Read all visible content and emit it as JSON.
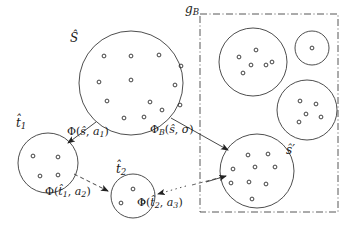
{
  "figure": {
    "type": "diagram",
    "background_color": "#ffffff",
    "stroke_color": "#333333"
  },
  "boundary_box": {
    "label_base": "g",
    "label_sub": "B",
    "style": "dash-dot",
    "x": 200,
    "y": 14,
    "width": 138,
    "height": 198
  },
  "circles": [
    {
      "name": "s-hat-circle",
      "label_base": "S",
      "label_accent": "hat",
      "label_prime": "",
      "cx": 131,
      "cy": 83,
      "r": 52,
      "label_x": 72,
      "label_y": 34,
      "points": 13
    },
    {
      "name": "t1-hat-circle",
      "label_base": "t",
      "label_accent": "hat",
      "label_sub": "1",
      "cx": 48,
      "cy": 163,
      "r": 30,
      "label_x": 18,
      "label_y": 119,
      "points": 4
    },
    {
      "name": "t2-hat-circle",
      "label_base": "t",
      "label_accent": "hat",
      "label_sub": "2",
      "cx": 133,
      "cy": 196,
      "r": 22,
      "label_x": 118,
      "label_y": 165,
      "points": 3
    },
    {
      "name": "s-prime-circle",
      "label_base": "s",
      "label_accent": "hat",
      "label_prime": "'",
      "cx": 257,
      "cy": 171,
      "r": 37,
      "label_x": 288,
      "label_y": 147,
      "points": 9
    },
    {
      "name": "cluster-circle-top-left",
      "label_base": "",
      "cx": 253,
      "cy": 62,
      "r": 34,
      "points": 6
    },
    {
      "name": "cluster-circle-top-right",
      "label_base": "",
      "cx": 312,
      "cy": 48,
      "r": 17,
      "points": 1
    },
    {
      "name": "cluster-circle-mid-right",
      "label_base": "",
      "cx": 307,
      "cy": 110,
      "r": 30,
      "points": 5
    }
  ],
  "edges": [
    {
      "name": "edge-s-to-t1",
      "style": "solid",
      "label": "Φ(ŝ, a₁)",
      "label_x": 69,
      "label_y": 130,
      "from": "s-hat-circle",
      "to": "t1-hat-circle"
    },
    {
      "name": "edge-t1-to-t2",
      "style": "dashed",
      "label": "Φ(t̂1, a₂)",
      "label_x": 47,
      "label_y": 190,
      "from": "t1-hat-circle",
      "to": "t2-hat-circle"
    },
    {
      "name": "edge-t2-to-next",
      "style": "dotted",
      "label": "Φ(t̂2, a₃)",
      "label_x": 139,
      "label_y": 200,
      "from": "t2-hat-circle",
      "to": "s-prime-circle"
    },
    {
      "name": "edge-s-to-sprime",
      "style": "solid",
      "label": "ΦB(ŝ, σ)",
      "label_x": 152,
      "label_y": 128,
      "from": "s-hat-circle",
      "to": "s-prime-circle"
    }
  ],
  "edge_labels": {
    "phi_s_a1": {
      "fn": "Φ",
      "args_open": "(",
      "arg1": "ŝ",
      "comma": ", ",
      "arg2": "a",
      "arg2_sub": "1",
      "args_close": ")"
    },
    "phi_t1_a2": {
      "fn": "Φ",
      "args_open": "(",
      "arg1": "t̂",
      "arg1_sub": "1",
      "comma": ", ",
      "arg2": "a",
      "arg2_sub": "2",
      "args_close": ")"
    },
    "phi_t2_a3": {
      "fn": "Φ",
      "args_open": "(",
      "arg1": "t̂",
      "arg1_sub": "2",
      "comma": ", ",
      "arg2": "a",
      "arg2_sub": "3",
      "args_close": ")"
    },
    "phi_B_s_sig": {
      "fn": "Φ",
      "fn_sub": "B",
      "args_open": "(",
      "arg1": "ŝ",
      "comma": ", ",
      "arg2": "σ",
      "args_close": ")"
    }
  },
  "set_labels": {
    "s_hat": "Ŝ",
    "t1_hat": "t̂",
    "t1_sub": "1",
    "t2_hat": "t̂",
    "t2_sub": "2",
    "s_prime": "ŝ′",
    "g_B": "g",
    "g_B_sub": "B"
  },
  "points": {
    "s_hat_circle": [
      [
        104,
        56
      ],
      [
        131,
        56
      ],
      [
        159,
        55
      ],
      [
        181,
        66
      ],
      [
        99,
        82
      ],
      [
        131,
        80
      ],
      [
        175,
        85
      ],
      [
        107,
        101
      ],
      [
        150,
        102
      ],
      [
        180,
        105
      ],
      [
        124,
        118
      ],
      [
        144,
        117
      ],
      [
        162,
        110
      ]
    ],
    "t1_circle": [
      [
        33,
        156
      ],
      [
        58,
        157
      ],
      [
        40,
        176
      ],
      [
        58,
        175
      ]
    ],
    "t2_circle": [
      [
        133,
        189
      ],
      [
        121,
        203
      ],
      [
        143,
        202
      ]
    ],
    "s_prime_circle": [
      [
        248,
        155
      ],
      [
        268,
        154
      ],
      [
        233,
        169
      ],
      [
        255,
        167
      ],
      [
        275,
        167
      ],
      [
        231,
        183
      ],
      [
        249,
        182
      ],
      [
        266,
        184
      ],
      [
        252,
        199
      ]
    ],
    "cluster_top_left": [
      [
        239,
        57
      ],
      [
        256,
        50
      ],
      [
        266,
        65
      ],
      [
        243,
        73
      ],
      [
        251,
        65
      ],
      [
        272,
        62
      ]
    ],
    "cluster_top_right": [
      [
        312,
        48
      ]
    ],
    "cluster_mid_right": [
      [
        300,
        101
      ],
      [
        316,
        104
      ],
      [
        306,
        114
      ],
      [
        321,
        117
      ],
      [
        299,
        122
      ]
    ]
  }
}
